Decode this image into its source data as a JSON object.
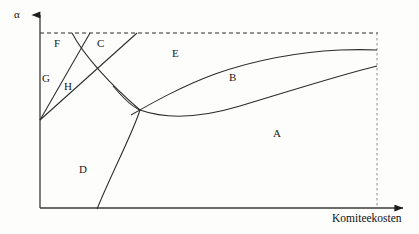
{
  "figure": {
    "type": "phase-diagram",
    "background_color": "#fdfdfc",
    "line_color": "#2b2b2b",
    "axes": {
      "y_axis_label": "α",
      "x_axis_label": "Komiteekosten",
      "y_axis_label_position": {
        "x": 14,
        "y": 9
      },
      "x_axis_label_position": {
        "x": 332,
        "y": 213
      },
      "origin": {
        "x": 40,
        "y": 208
      },
      "x_axis_end": {
        "x": 410,
        "y": 208
      },
      "y_axis_top": {
        "x": 40,
        "y": 12
      },
      "arrowheads": [
        "y-axis-top",
        "x-axis-right"
      ]
    },
    "guides": {
      "top_dashed": {
        "y": 33,
        "x_start": 40,
        "x_end": 378,
        "style": "dashed"
      },
      "right_dashed": {
        "x": 377,
        "y_start": 33,
        "y_end": 208,
        "style": "dashed"
      }
    },
    "region_labels": [
      {
        "id": "A",
        "text": "A",
        "x": 273,
        "y": 128
      },
      {
        "id": "B",
        "text": "B",
        "x": 229,
        "y": 72
      },
      {
        "id": "C",
        "text": "C",
        "x": 97,
        "y": 38
      },
      {
        "id": "D",
        "text": "D",
        "x": 79,
        "y": 164
      },
      {
        "id": "E",
        "text": "E",
        "x": 172,
        "y": 48
      },
      {
        "id": "F",
        "text": "F",
        "x": 54,
        "y": 38
      },
      {
        "id": "G",
        "text": "G",
        "x": 42,
        "y": 73
      },
      {
        "id": "H",
        "text": "H",
        "x": 64,
        "y": 81
      }
    ],
    "curves": [
      {
        "id": "ray-upper-steep",
        "description": "straight ray from vertex to top dashed line (left of C)",
        "points": [
          [
            40,
            120
          ],
          [
            90,
            33
          ]
        ]
      },
      {
        "id": "ray-lower-shallow",
        "description": "straight ray from vertex rising to top dashed line at right of C",
        "points": [
          [
            40,
            120
          ],
          [
            137,
            33
          ]
        ]
      },
      {
        "id": "curve-FH-descending",
        "description": "curve from top dashed line descending through crossing toward bottom axis (boundary of D)",
        "points": [
          [
            72,
            33
          ],
          [
            100,
            70
          ],
          [
            125,
            97
          ],
          [
            140,
            110
          ],
          [
            130,
            140
          ],
          [
            110,
            175
          ],
          [
            97,
            208
          ]
        ]
      },
      {
        "id": "curve-lower-band",
        "description": "lower boundary of band B rising to the right",
        "points": [
          [
            115,
            88
          ],
          [
            140,
            110
          ],
          [
            175,
            118
          ],
          [
            215,
            112
          ],
          [
            265,
            97
          ],
          [
            320,
            80
          ],
          [
            377,
            66
          ]
        ]
      },
      {
        "id": "curve-upper-band",
        "description": "upper boundary of band B rising to the right and flattening",
        "points": [
          [
            132,
            114
          ],
          [
            165,
            96
          ],
          [
            205,
            78
          ],
          [
            250,
            65
          ],
          [
            300,
            55
          ],
          [
            340,
            51
          ],
          [
            377,
            50
          ]
        ]
      }
    ]
  }
}
